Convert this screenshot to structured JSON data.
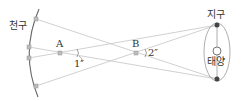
{
  "labels": {
    "sphere": "천구",
    "star_a": "A",
    "star_b": "B",
    "angle_a": "1″",
    "angle_b": "2″",
    "earth": "지구",
    "sun": "태양"
  },
  "colors": {
    "line": "#b8b8b8",
    "arc": "#555555",
    "text": "#333333",
    "earth": "#444444"
  }
}
